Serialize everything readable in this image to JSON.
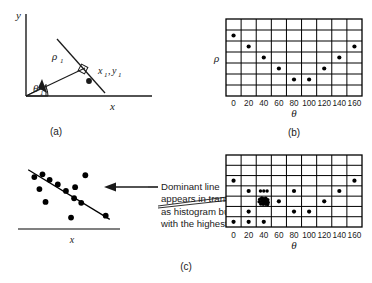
{
  "figure": {
    "title_caption_a": "(a)",
    "title_caption_b": "(b)",
    "title_caption_c": "(c)",
    "colors": {
      "ink": "#1a1a1a",
      "grid": "#000000",
      "rule": "#808080",
      "background": "#ffffff"
    }
  },
  "panel_a": {
    "caption": "(a)",
    "axis_y_label": "y",
    "axis_x_label": "x",
    "rho_label": "ρ",
    "rho_sub": "1",
    "theta_label": "θ",
    "theta_sub": "1",
    "point_label": "x",
    "point_sub1": "1",
    "point_label2": "y",
    "point_sub2": "1",
    "right_angle_marker": "square-marker"
  },
  "panel_b": {
    "caption": "(b)",
    "axis_y_label": "ρ",
    "axis_x_label": "θ",
    "tick_labels": [
      "0",
      "20",
      "40",
      "60",
      "80",
      "100",
      "120",
      "140",
      "160"
    ],
    "grid_cols": 9,
    "grid_rows": 7,
    "dots": [
      {
        "col": 0,
        "row": 1
      },
      {
        "col": 1,
        "row": 2
      },
      {
        "col": 2,
        "row": 3
      },
      {
        "col": 3,
        "row": 4
      },
      {
        "col": 4,
        "row": 5
      },
      {
        "col": 5,
        "row": 5
      },
      {
        "col": 6,
        "row": 4
      },
      {
        "col": 7,
        "row": 3
      },
      {
        "col": 8,
        "row": 2
      }
    ]
  },
  "panel_c": {
    "caption": "(c)",
    "scatter_axis_x_label": "x",
    "annotation_lines": [
      "Dominant line",
      "appears in transform space",
      "as histogram bucket",
      "with the highest count"
    ],
    "axis_y_label": "ρ",
    "axis_x_label": "θ",
    "tick_labels": [
      "0",
      "20",
      "40",
      "60",
      "80",
      "100",
      "120",
      "140",
      "160"
    ],
    "grid_cols": 9,
    "grid_rows": 7,
    "scatter_points": [
      {
        "x": 16,
        "y": 24
      },
      {
        "x": 24,
        "y": 21
      },
      {
        "x": 21,
        "y": 37
      },
      {
        "x": 31,
        "y": 27
      },
      {
        "x": 39,
        "y": 32
      },
      {
        "x": 27,
        "y": 51
      },
      {
        "x": 47,
        "y": 39
      },
      {
        "x": 56,
        "y": 35
      },
      {
        "x": 55,
        "y": 47
      },
      {
        "x": 62,
        "y": 52
      },
      {
        "x": 66,
        "y": 22
      },
      {
        "x": 52,
        "y": 68
      },
      {
        "x": 86,
        "y": 66
      }
    ],
    "dominant_line": {
      "x1": 10,
      "y1": 16,
      "x2": 90,
      "y2": 70
    },
    "dots": [
      {
        "col": 0,
        "row": 2
      },
      {
        "col": 8,
        "row": 2
      },
      {
        "col": 1,
        "row": 3
      },
      {
        "col": 4,
        "row": 3
      },
      {
        "col": 7,
        "row": 3
      },
      {
        "col": 3,
        "row": 4
      },
      {
        "col": 6,
        "row": 4
      },
      {
        "col": 1,
        "row": 5
      },
      {
        "col": 4,
        "row": 5
      },
      {
        "col": 5,
        "row": 5
      },
      {
        "col": 0,
        "row": 6
      },
      {
        "col": 1,
        "row": 6
      },
      {
        "col": 2,
        "row": 6
      }
    ],
    "cluster_row_dots": [
      {
        "col": 2,
        "row": 3,
        "offset": -0.22
      },
      {
        "col": 2,
        "row": 3,
        "offset": 0.0
      },
      {
        "col": 2,
        "row": 3,
        "offset": 0.22
      }
    ],
    "highlight_bucket": {
      "col": 2,
      "row": 4,
      "label": "highest-count-bucket"
    }
  }
}
